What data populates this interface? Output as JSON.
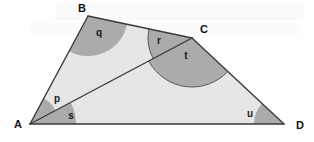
{
  "figure": {
    "kind": "geometry-diagram",
    "width": 314,
    "height": 142,
    "background_color": "#ffffff"
  },
  "colors": {
    "interior_fill": "#e6e6e6",
    "sector_fill": "#b3b3b3",
    "sector_fill_dark": "#ababab",
    "edge_stroke": "#3a3a3a",
    "arc_stroke": "#5a5a5a",
    "label_color": "#111111",
    "watermark_color": "#f4f4f4"
  },
  "vertices": [
    {
      "id": "A",
      "label": "A",
      "x": 30,
      "y": 124,
      "label_x": 14,
      "label_y": 128
    },
    {
      "id": "B",
      "label": "B",
      "x": 88,
      "y": 16,
      "label_x": 78,
      "label_y": 12
    },
    {
      "id": "C",
      "label": "C",
      "x": 192,
      "y": 38,
      "label_x": 200,
      "label_y": 33
    },
    {
      "id": "D",
      "label": "D",
      "x": 284,
      "y": 124,
      "label_x": 296,
      "label_y": 129
    }
  ],
  "edges": [
    {
      "id": "AB",
      "from": "A",
      "to": "B"
    },
    {
      "id": "BC",
      "from": "B",
      "to": "C"
    },
    {
      "id": "CD",
      "from": "C",
      "to": "D"
    },
    {
      "id": "DA",
      "from": "D",
      "to": "A"
    }
  ],
  "diagonal": {
    "id": "AC",
    "from": "A",
    "to": "C"
  },
  "polygon_points": "30,124 88,16 192,38 284,124",
  "angles": [
    {
      "id": "p",
      "label": "p",
      "at_vertex": "A",
      "between": [
        "AB",
        "AC"
      ],
      "label_x": 57,
      "label_y": 102,
      "radius": 29,
      "fill": "#ababab",
      "has_outline": false
    },
    {
      "id": "q",
      "label": "q",
      "at_vertex": "B",
      "between": [
        "BA",
        "BC"
      ],
      "label_x": 99,
      "label_y": 36,
      "radius": 40,
      "fill": "#ababab",
      "has_outline": false
    },
    {
      "id": "r",
      "label": "r",
      "at_vertex": "C",
      "between": [
        "CB",
        "CA"
      ],
      "label_x": 159,
      "label_y": 44,
      "radius": 44,
      "fill": "#ababab",
      "has_outline": true
    },
    {
      "id": "s",
      "label": "s",
      "at_vertex": "A",
      "between": [
        "AC",
        "AD"
      ],
      "label_x": 71,
      "label_y": 119,
      "radius": 46,
      "fill": "#ababab",
      "has_outline": false
    },
    {
      "id": "t",
      "label": "t",
      "at_vertex": "C",
      "between": [
        "CA",
        "CD"
      ],
      "label_x": 186,
      "label_y": 59,
      "radius": 49,
      "fill": "#ababab",
      "has_outline": true
    },
    {
      "id": "u",
      "label": "u",
      "at_vertex": "D",
      "between": [
        "DC",
        "DA"
      ],
      "label_x": 250,
      "label_y": 117,
      "radius": 30,
      "fill": "#ababab",
      "has_outline": false
    }
  ],
  "watermark": {
    "visible": true,
    "text": ""
  }
}
